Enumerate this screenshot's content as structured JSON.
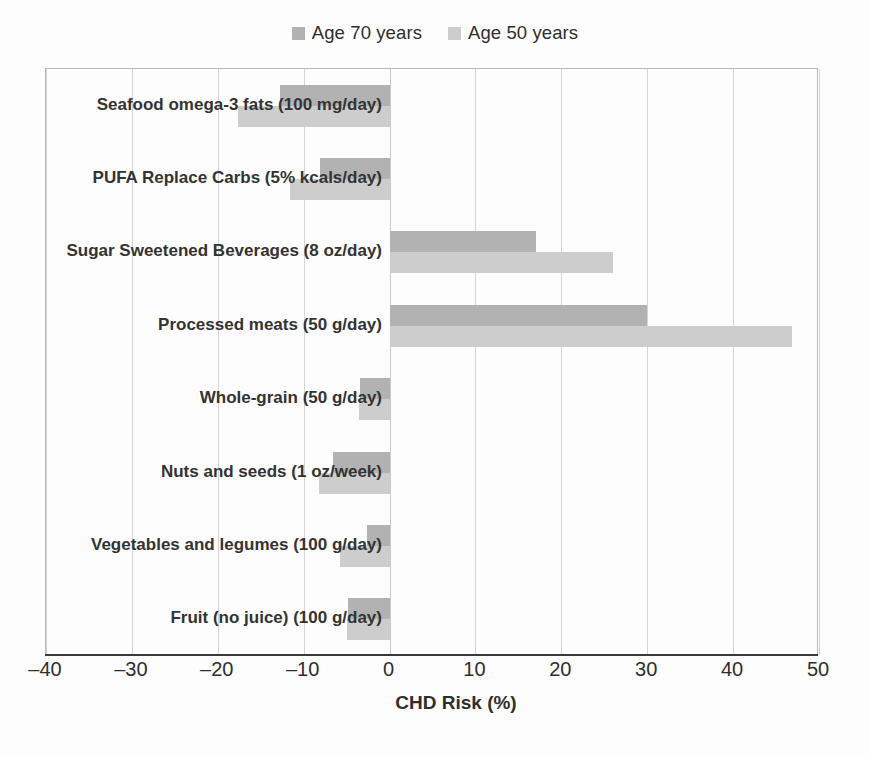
{
  "chart_data": {
    "type": "bar",
    "orientation": "horizontal",
    "title": "",
    "subtitle": "",
    "xlabel": "CHD Risk (%)",
    "ylabel": "",
    "xlim": [
      -40,
      50
    ],
    "xticks": [
      -40,
      -30,
      -20,
      -10,
      0,
      10,
      20,
      30,
      40,
      50
    ],
    "xticklabels": [
      "–40",
      "–30",
      "–20",
      "–10",
      "0",
      "10",
      "20",
      "30",
      "40",
      "50"
    ],
    "grid": "vertical",
    "legend_position": "top-center",
    "categories": [
      "Seafood omega-3 fats (100 mg/day)",
      "PUFA Replace Carbs (5% kcals/day)",
      "Sugar Sweetened Beverages (8 oz/day)",
      "Processed meats (50 g/day)",
      "Whole-grain (50 g/day)",
      "Nuts and seeds (1 oz/week)",
      "Vegetables and legumes (100 g/day)",
      "Fruit (no juice) (100 g/day)"
    ],
    "series": [
      {
        "name": "Age 70 years",
        "color": "#b2b2b2",
        "values": [
          -12.8,
          -8.1,
          17.0,
          30.0,
          -3.4,
          -6.6,
          -2.6,
          -4.8
        ]
      },
      {
        "name": "Age 50 years",
        "color": "#cdcdcd",
        "values": [
          -17.7,
          -11.6,
          26.0,
          46.8,
          -3.6,
          -8.2,
          -5.8,
          -4.9
        ]
      }
    ],
    "annotations": []
  },
  "legend": {
    "entries": [
      {
        "label": "Age 70 years",
        "color": "#b2b2b2",
        "swatch_name": "legend-swatch-age-70"
      },
      {
        "label": "Age 50 years",
        "color": "#cdcdcd",
        "swatch_name": "legend-swatch-age-50"
      }
    ]
  },
  "colors": {
    "background": "#fdfdfd",
    "axis_line": "#3a3a3a",
    "grid_line": "#d4d4d4",
    "plot_border": "#b9b9b9",
    "text": "#2e2e2e",
    "category_text": "#333333"
  }
}
